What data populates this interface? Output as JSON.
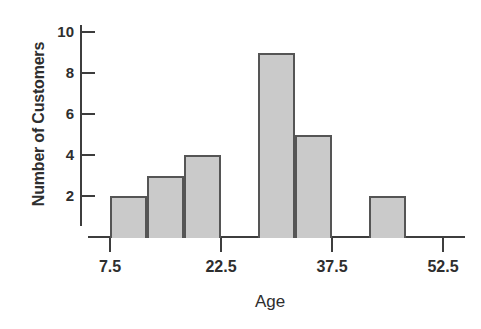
{
  "chart_data": {
    "type": "bar",
    "title": "",
    "xlabel": "Age",
    "ylabel": "Number of Customers",
    "grid": false,
    "legend": false,
    "bin_width": 5,
    "bin_edges": [
      7.5,
      12.5,
      17.5,
      22.5,
      27.5,
      32.5,
      37.5,
      42.5,
      47.5,
      52.5
    ],
    "bars": [
      {
        "left": 7.5,
        "right": 12.5,
        "value": 2
      },
      {
        "left": 12.5,
        "right": 17.5,
        "value": 3
      },
      {
        "left": 17.5,
        "right": 22.5,
        "value": 4
      },
      {
        "left": 27.5,
        "right": 32.5,
        "value": 9
      },
      {
        "left": 32.5,
        "right": 37.5,
        "value": 5
      },
      {
        "left": 42.5,
        "right": 47.5,
        "value": 2
      }
    ],
    "values": [
      2,
      3,
      4,
      9,
      5,
      2
    ],
    "categories": [
      "7.5-12.5",
      "12.5-17.5",
      "17.5-22.5",
      "27.5-32.5",
      "32.5-37.5",
      "42.5-47.5"
    ],
    "xlim": [
      7.5,
      52.5
    ],
    "ylim": [
      0,
      10
    ],
    "x_ticks": [
      {
        "value": 7.5,
        "label": "7.5"
      },
      {
        "value": 22.5,
        "label": "22.5"
      },
      {
        "value": 37.5,
        "label": "37.5"
      },
      {
        "value": 52.5,
        "label": "52.5"
      }
    ],
    "y_ticks": [
      {
        "value": 2,
        "label": "2"
      },
      {
        "value": 4,
        "label": "4"
      },
      {
        "value": 6,
        "label": "6"
      },
      {
        "value": 8,
        "label": "8"
      },
      {
        "value": 10,
        "label": "10"
      }
    ],
    "colors": {
      "bar_fill": "#cacaca",
      "bar_edge": "#555555",
      "axis": "#3d3d3d",
      "text": "#2e2e2e",
      "background": "#ffffff"
    }
  }
}
